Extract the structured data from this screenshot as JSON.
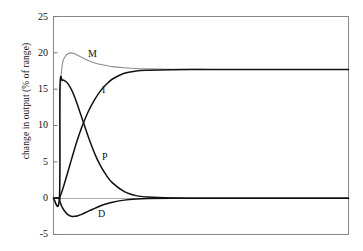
{
  "chart_data": {
    "type": "line",
    "title": "",
    "xlabel": "",
    "ylabel": "change in output (% of range)",
    "ylim": [
      -5,
      25
    ],
    "xlim": [
      0,
      100
    ],
    "grid": false,
    "legend_position": "inline-curve-labels",
    "yticks": [
      25,
      20,
      15,
      10,
      5,
      0,
      -5
    ],
    "ytick_labels": [
      "25",
      "20",
      "15",
      "10",
      "5",
      "0",
      "-5"
    ],
    "xticks": [],
    "xtick_labels": [],
    "series": [
      {
        "name": "M",
        "label": "M",
        "color": "#8c8c8c",
        "description": "total manipulated output, rises sharply to overshoot peak then settles",
        "x": [
          0,
          2,
          2.2,
          3,
          4,
          5,
          6,
          7,
          8,
          9,
          10,
          12,
          14,
          16,
          18,
          20,
          24,
          28,
          32,
          40,
          50,
          60,
          80,
          100
        ],
        "y": [
          0,
          0,
          13.7,
          18.4,
          19.5,
          19.9,
          20.0,
          19.9,
          19.7,
          19.5,
          19.3,
          18.9,
          18.6,
          18.4,
          18.25,
          18.1,
          17.95,
          17.85,
          17.8,
          17.75,
          17.72,
          17.7,
          17.7,
          17.7
        ]
      },
      {
        "name": "P",
        "label": "P",
        "color": "#111111",
        "description": "proportional contribution, steps to 16.2 then decays to 0",
        "x": [
          0,
          2,
          2.2,
          3,
          4,
          5,
          6,
          7,
          8,
          9,
          10,
          12,
          14,
          16,
          18,
          20,
          24,
          28,
          32,
          40,
          50,
          60,
          80,
          100
        ],
        "y": [
          0,
          0,
          15.3,
          16.2,
          16.1,
          15.7,
          15.0,
          14.1,
          13.0,
          11.8,
          10.6,
          8.2,
          6.1,
          4.4,
          3.1,
          2.1,
          0.9,
          0.35,
          0.15,
          0.03,
          0.0,
          0.0,
          0.0,
          0.0
        ]
      },
      {
        "name": "I",
        "label": "I",
        "color": "#111111",
        "description": "integral contribution, ramps up from 0 to final offset",
        "x": [
          0,
          2,
          2.2,
          3,
          4,
          5,
          6,
          7,
          8,
          9,
          10,
          12,
          14,
          16,
          18,
          20,
          24,
          28,
          32,
          40,
          50,
          60,
          80,
          100
        ],
        "y": [
          0,
          0,
          0.2,
          1.1,
          2.4,
          3.8,
          5.2,
          6.6,
          7.9,
          9.1,
          10.2,
          12.1,
          13.6,
          14.8,
          15.7,
          16.4,
          17.2,
          17.5,
          17.6,
          17.68,
          17.7,
          17.7,
          17.7,
          17.7
        ]
      },
      {
        "name": "D",
        "label": "D",
        "color": "#111111",
        "description": "derivative contribution, dips negative then returns to 0",
        "x": [
          0,
          2,
          2.2,
          3,
          4,
          5,
          6,
          7,
          8,
          9,
          10,
          12,
          14,
          16,
          18,
          20,
          24,
          28,
          32,
          40,
          50,
          60,
          80,
          100
        ],
        "y": [
          0,
          0,
          -0.5,
          -1.3,
          -1.9,
          -2.3,
          -2.5,
          -2.5,
          -2.45,
          -2.3,
          -2.15,
          -1.75,
          -1.4,
          -1.05,
          -0.78,
          -0.56,
          -0.27,
          -0.12,
          -0.05,
          -0.01,
          0.0,
          0.0,
          0.0,
          0.0
        ]
      }
    ],
    "zero_line": 0,
    "curve_labels": [
      {
        "text": "M",
        "x_px": 88,
        "y_px": 49
      },
      {
        "text": "I",
        "x_px": 102,
        "y_px": 85
      },
      {
        "text": "P",
        "x_px": 102,
        "y_px": 152
      },
      {
        "text": "D",
        "x_px": 98,
        "y_px": 209
      }
    ]
  },
  "colors": {
    "axis": "#777777",
    "curve_dark": "#111111",
    "curve_gray": "#8c8c8c",
    "background": "#ffffff"
  }
}
